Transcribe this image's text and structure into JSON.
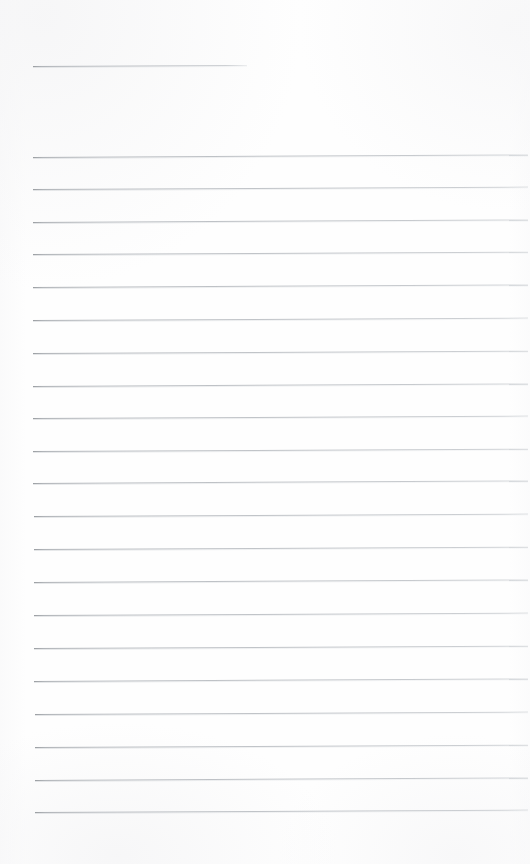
{
  "document": {
    "kind": "scanned-ruled-notepad-page",
    "title_text": "",
    "body_text": "",
    "is_blank": true,
    "page_width": 530,
    "page_height": 864,
    "background_color": "#fefefe",
    "rule_color": "#b4b8bd",
    "rule_thickness_px": 1
  },
  "layout": {
    "left_margin_x": 33,
    "right_margin_x": 528,
    "rule_spacing_px": 32.4,
    "first_body_rule_y": 157,
    "last_body_rule_y": 812,
    "bottom_blank_margin_px": 52
  },
  "title_rule": {
    "label": "title-underline",
    "x": 33,
    "y": 66,
    "width": 214,
    "slant_deg": -0.28
  },
  "body_rules": [
    {
      "index": 1,
      "y": 157,
      "x": 33,
      "width": 495,
      "slant_deg": -0.3
    },
    {
      "index": 2,
      "y": 189,
      "x": 33,
      "width": 495,
      "slant_deg": -0.28
    },
    {
      "index": 3,
      "y": 222,
      "x": 33,
      "width": 495,
      "slant_deg": -0.3
    },
    {
      "index": 4,
      "y": 254,
      "x": 33,
      "width": 495,
      "slant_deg": -0.26
    },
    {
      "index": 5,
      "y": 287,
      "x": 33,
      "width": 495,
      "slant_deg": -0.3
    },
    {
      "index": 6,
      "y": 320,
      "x": 33,
      "width": 495,
      "slant_deg": -0.28
    },
    {
      "index": 7,
      "y": 353,
      "x": 33,
      "width": 495,
      "slant_deg": -0.26
    },
    {
      "index": 8,
      "y": 386,
      "x": 33,
      "width": 495,
      "slant_deg": -0.3
    },
    {
      "index": 9,
      "y": 418,
      "x": 33,
      "width": 495,
      "slant_deg": -0.28
    },
    {
      "index": 10,
      "y": 451,
      "x": 33,
      "width": 495,
      "slant_deg": -0.26
    },
    {
      "index": 11,
      "y": 483,
      "x": 33,
      "width": 495,
      "slant_deg": -0.3
    },
    {
      "index": 12,
      "y": 516,
      "x": 34,
      "width": 494,
      "slant_deg": -0.28
    },
    {
      "index": 13,
      "y": 549,
      "x": 34,
      "width": 494,
      "slant_deg": -0.26
    },
    {
      "index": 14,
      "y": 582,
      "x": 34,
      "width": 494,
      "slant_deg": -0.3
    },
    {
      "index": 15,
      "y": 615,
      "x": 34,
      "width": 494,
      "slant_deg": -0.28
    },
    {
      "index": 16,
      "y": 648,
      "x": 34,
      "width": 494,
      "slant_deg": -0.26
    },
    {
      "index": 17,
      "y": 681,
      "x": 34,
      "width": 494,
      "slant_deg": -0.3
    },
    {
      "index": 18,
      "y": 714,
      "x": 35,
      "width": 493,
      "slant_deg": -0.28
    },
    {
      "index": 19,
      "y": 747,
      "x": 35,
      "width": 493,
      "slant_deg": -0.26
    },
    {
      "index": 20,
      "y": 780,
      "x": 35,
      "width": 493,
      "slant_deg": -0.3
    },
    {
      "index": 21,
      "y": 812,
      "x": 35,
      "width": 493,
      "slant_deg": -0.28
    }
  ]
}
